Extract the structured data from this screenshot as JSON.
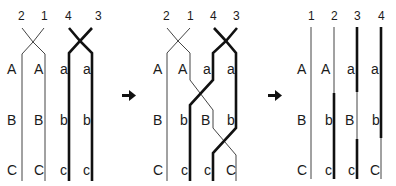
{
  "panels": [
    {
      "name": "before-crossover",
      "strand_numbers": [
        "2",
        "1",
        "4",
        "3"
      ],
      "rows": [
        [
          "A",
          "A",
          "a",
          "a"
        ],
        [
          "B",
          "B",
          "b",
          "b"
        ],
        [
          "C",
          "C",
          "c",
          "c"
        ]
      ]
    },
    {
      "name": "during-crossover",
      "strand_numbers": [
        "2",
        "1",
        "4",
        "3"
      ],
      "rows": [
        [
          "A",
          "A",
          "a",
          "a"
        ],
        [
          "B",
          "b",
          "B",
          "b"
        ],
        [
          "C",
          "c",
          "c",
          "C"
        ]
      ]
    },
    {
      "name": "after-crossover",
      "strand_numbers": [
        "1",
        "2",
        "3",
        "4"
      ],
      "rows": [
        [
          "A",
          "A",
          "a",
          "a"
        ],
        [
          "B",
          "b",
          "B",
          "b"
        ],
        [
          "C",
          "c",
          "c",
          "C"
        ]
      ]
    }
  ],
  "arrows": [
    "right-arrow",
    "right-arrow"
  ],
  "colors": {
    "line": "#1a1a1a",
    "thin_line": "#444444",
    "background": "#ffffff"
  }
}
